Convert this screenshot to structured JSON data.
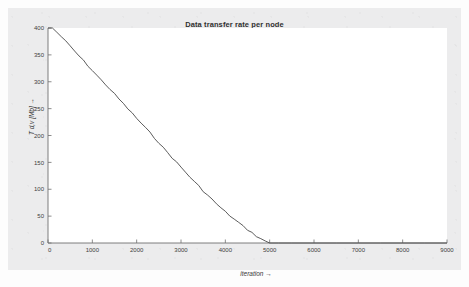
{
  "figure": {
    "title": "Data transfer rate per node",
    "background_color": "#ececed",
    "plot_background_color": "#ffffff",
    "axis_color": "#6f6f6f",
    "line_color": "#4a4a4a"
  },
  "chart_data": {
    "type": "line",
    "title": "Data transfer rate per node",
    "xlabel": "iteration  →",
    "ylabel": "T d,v  [Mb]  →",
    "xlim": [
      0,
      9000
    ],
    "ylim": [
      0,
      400
    ],
    "xticks": [
      0,
      1000,
      2000,
      3000,
      4000,
      5000,
      6000,
      7000,
      8000,
      9000
    ],
    "xticklabels": [
      "0",
      "1000",
      "2000",
      "3000",
      "4000",
      "5000",
      "6000",
      "7000",
      "8000",
      "9000"
    ],
    "yticks": [
      0,
      50,
      100,
      150,
      200,
      250,
      300,
      350,
      400
    ],
    "yticklabels": [
      "0",
      "50",
      "100",
      "150",
      "200",
      "250",
      "300",
      "350",
      "400"
    ],
    "grid": false,
    "legend": null,
    "series": [
      {
        "name": "data transfer rate",
        "x": [
          0,
          100,
          200,
          300,
          400,
          500,
          600,
          700,
          800,
          900,
          1000,
          1100,
          1200,
          1300,
          1400,
          1500,
          1600,
          1700,
          1800,
          1900,
          2000,
          2100,
          2200,
          2300,
          2400,
          2500,
          2600,
          2700,
          2800,
          2900,
          3000,
          3100,
          3200,
          3300,
          3400,
          3500,
          3600,
          3700,
          3800,
          3900,
          4000,
          4100,
          4200,
          4300,
          4400,
          4500,
          4600,
          4700,
          4800,
          4900,
          5000,
          5200,
          5500,
          6000,
          6500,
          7000,
          7500,
          8000,
          8500,
          9000
        ],
        "y": [
          400,
          400,
          392,
          384,
          375,
          366,
          357,
          348,
          339,
          330,
          321,
          312,
          303,
          295,
          286,
          277,
          268,
          259,
          250,
          241,
          232,
          223,
          214,
          205,
          196,
          187,
          177,
          168,
          159,
          150,
          141,
          132,
          123,
          114,
          106,
          97,
          89,
          81,
          73,
          65,
          58,
          51,
          44,
          38,
          31,
          25,
          19,
          13,
          8,
          3,
          0,
          0,
          0,
          0,
          0,
          0,
          0,
          0,
          0,
          0
        ]
      }
    ]
  }
}
